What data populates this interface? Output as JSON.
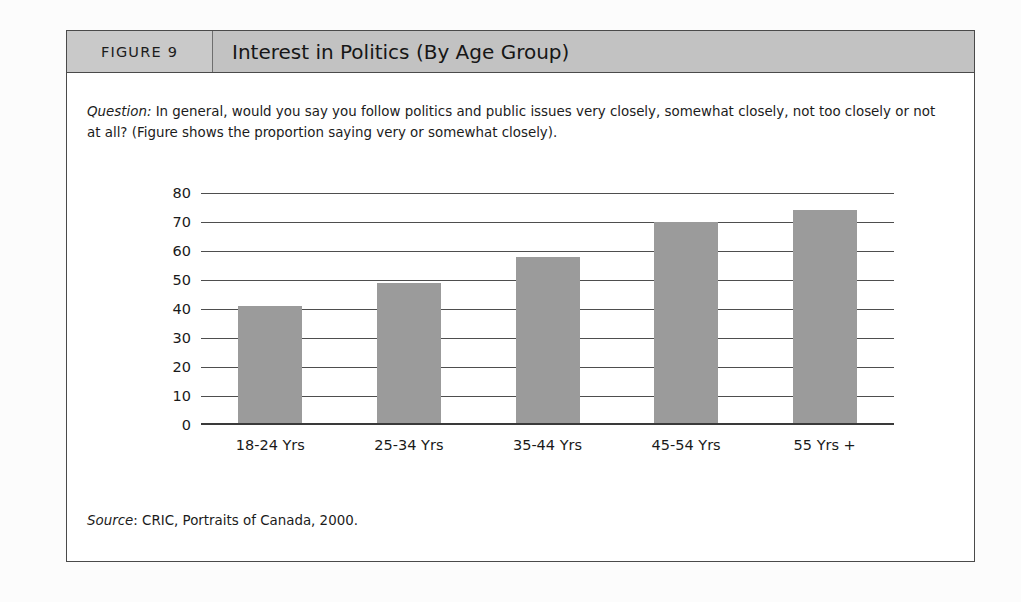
{
  "figure": {
    "number_label": "FIGURE 9",
    "title": "Interest in Politics (By Age Group)",
    "question_label": "Question:",
    "question_text": " In general, would you say you follow politics and public issues very closely, somewhat closely, not too closely or not at all? (Figure shows the proportion saying very or somewhat closely).",
    "source_label": "Source",
    "source_text": ": CRIC, Portraits of Canada, 2000."
  },
  "colors": {
    "bar_fill": "#9b9b9b",
    "header_band": "#c6c6c6",
    "frame_border": "#4a4a4a",
    "gridline": "#4e4e4e",
    "text": "#1a1a1a"
  },
  "chart_data": {
    "type": "bar",
    "title": "Interest in Politics (By Age Group)",
    "categories": [
      "18-24 Yrs",
      "25-34 Yrs",
      "35-44 Yrs",
      "45-54 Yrs",
      "55 Yrs +"
    ],
    "values": [
      41,
      49,
      58,
      70,
      74
    ],
    "xlabel": "",
    "ylabel": "",
    "ylim": [
      0,
      80
    ],
    "yticks": [
      0,
      10,
      20,
      30,
      40,
      50,
      60,
      70,
      80
    ],
    "ytick_labels": [
      "0",
      "10",
      "20",
      "30",
      "40",
      "50",
      "60",
      "70",
      "80"
    ],
    "grid": true,
    "legend": false
  }
}
